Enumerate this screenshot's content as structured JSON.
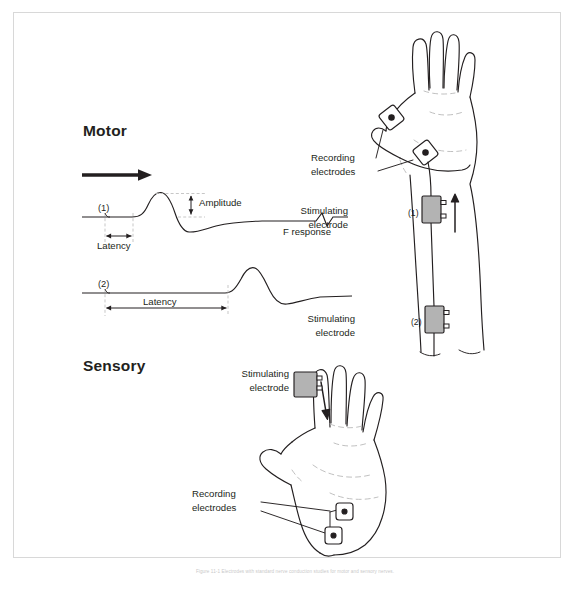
{
  "figure": {
    "caption": "Figure 11-1 Electrodes with standard nerve conduction studies for motor and sensory nerves."
  },
  "sections": {
    "motor": {
      "heading": "Motor"
    },
    "sensory": {
      "heading": "Sensory"
    }
  },
  "traces": {
    "trace1": {
      "id": "(1)",
      "latency_label": "Latency",
      "amplitude_label": "Amplitude",
      "f_response_label": "F response"
    },
    "trace2": {
      "id": "(2)",
      "latency_label": "Latency"
    }
  },
  "motor_diagram": {
    "recording_electrodes_label": "Recording\nelectrodes",
    "recording_line1": "Recording",
    "recording_line2": "electrodes",
    "stim1_line1": "Stimulating",
    "stim1_line2": "electrode",
    "stim1_id": "(1)",
    "stim2_line1": "Stimulating",
    "stim2_line2": "electrode",
    "stim2_id": "(2)"
  },
  "sensory_diagram": {
    "stim_line1": "Stimulating",
    "stim_line2": "electrode",
    "recording_line1": "Recording",
    "recording_line2": "electrodes"
  },
  "colors": {
    "ink": "#231f20",
    "electrode_fill": "#b3b3b3",
    "guide": "#bdbdbd",
    "frame": "#d8d8d8"
  }
}
